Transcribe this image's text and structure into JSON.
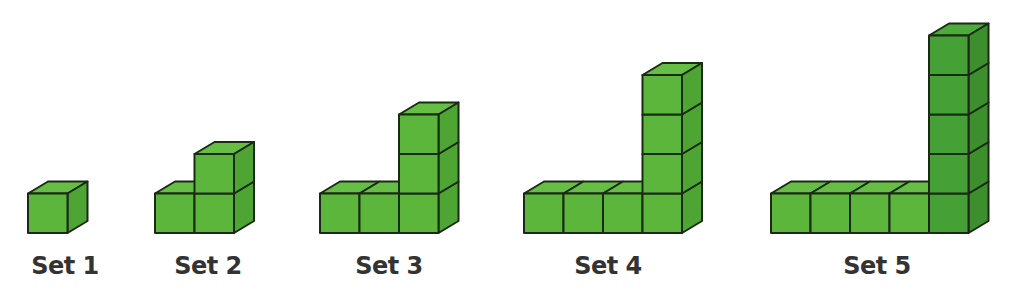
{
  "colors": {
    "front": "#5cb63c",
    "side": "#4fa534",
    "top": "#66be45",
    "front_dark": "#45a035",
    "side_dark": "#3c8f2c",
    "top_dark": "#4eaa3a",
    "edge": "#1a2a14",
    "label": "#333333"
  },
  "sets": [
    {
      "label": "Set 1",
      "row_cubes": 1,
      "column_cubes": 1
    },
    {
      "label": "Set 2",
      "row_cubes": 2,
      "column_cubes": 2
    },
    {
      "label": "Set 3",
      "row_cubes": 3,
      "column_cubes": 3
    },
    {
      "label": "Set 4",
      "row_cubes": 4,
      "column_cubes": 4
    },
    {
      "label": "Set 5",
      "row_cubes": 5,
      "column_cubes": 5
    }
  ]
}
